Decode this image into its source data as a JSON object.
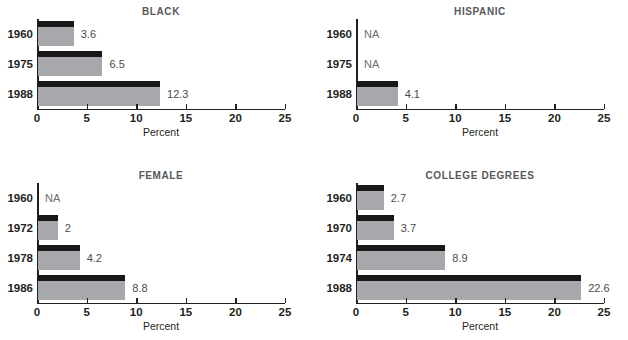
{
  "figure": {
    "background": "#ffffff",
    "bar_body_color": "#a6a8ab",
    "bar_cap_color": "#1a1718",
    "title_color": "#58595b",
    "value_label_color": "#4c4b4d",
    "na_text": "NA",
    "axis_title": "Percent"
  },
  "chart_data": [
    {
      "type": "bar",
      "orientation": "horizontal",
      "title": "BLACK",
      "xlabel": "Percent",
      "ylabel": "",
      "xlim": [
        0,
        25
      ],
      "xticks": [
        0,
        5,
        10,
        15,
        20,
        25
      ],
      "xticklabels": [
        "0",
        "5",
        "10",
        "15",
        "20",
        "25"
      ],
      "grid": false,
      "legend": "none",
      "categories": [
        "1960",
        "1975",
        "1988"
      ],
      "values": [
        3.6,
        6.5,
        12.3
      ],
      "datalabels": [
        "3.6",
        "6.5",
        "12.3"
      ]
    },
    {
      "type": "bar",
      "orientation": "horizontal",
      "title": "HISPANIC",
      "xlabel": "Percent",
      "ylabel": "",
      "xlim": [
        0,
        25
      ],
      "xticks": [
        0,
        5,
        10,
        15,
        20,
        25
      ],
      "xticklabels": [
        "0",
        "5",
        "10",
        "15",
        "20",
        "25"
      ],
      "grid": false,
      "legend": "none",
      "categories": [
        "1960",
        "1975",
        "1988"
      ],
      "values": [
        null,
        null,
        4.1
      ],
      "datalabels": [
        "NA",
        "NA",
        "4.1"
      ]
    },
    {
      "type": "bar",
      "orientation": "horizontal",
      "title": "FEMALE",
      "xlabel": "Percent",
      "ylabel": "",
      "xlim": [
        0,
        25
      ],
      "xticks": [
        0,
        5,
        10,
        15,
        20,
        25
      ],
      "xticklabels": [
        "0",
        "5",
        "10",
        "15",
        "20",
        "25"
      ],
      "grid": false,
      "legend": "none",
      "categories": [
        "1960",
        "1972",
        "1978",
        "1986"
      ],
      "values": [
        null,
        2,
        4.2,
        8.8
      ],
      "datalabels": [
        "NA",
        "2",
        "4.2",
        "8.8"
      ]
    },
    {
      "type": "bar",
      "orientation": "horizontal",
      "title": "COLLEGE DEGREES",
      "xlabel": "Percent",
      "ylabel": "",
      "xlim": [
        0,
        25
      ],
      "xticks": [
        0,
        5,
        10,
        15,
        20,
        25
      ],
      "xticklabels": [
        "0",
        "5",
        "10",
        "15",
        "20",
        "25"
      ],
      "grid": false,
      "legend": "none",
      "categories": [
        "1960",
        "1970",
        "1974",
        "1988"
      ],
      "values": [
        2.7,
        3.7,
        8.9,
        22.6
      ],
      "datalabels": [
        "2.7",
        "3.7",
        "8.9",
        "22.6"
      ]
    }
  ]
}
